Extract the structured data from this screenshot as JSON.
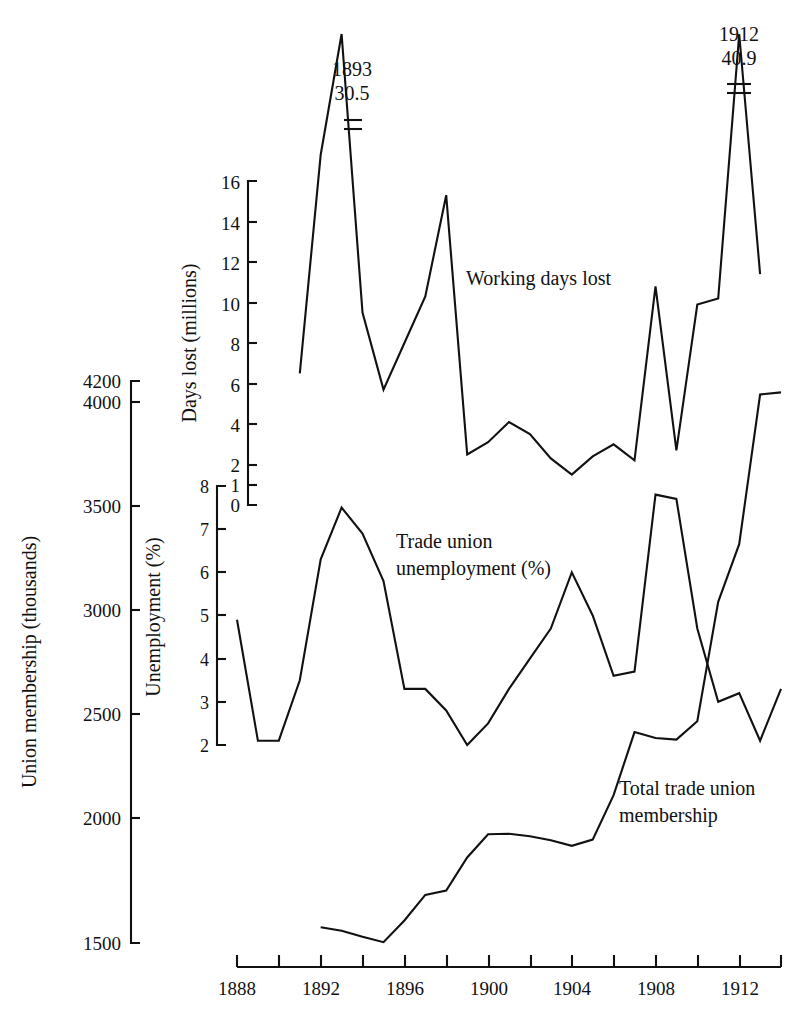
{
  "chart_data": {
    "type": "line",
    "title": "",
    "xlabel": "",
    "x_axis": {
      "min": 1888,
      "max": 1914,
      "tick_labels": [
        "1888",
        "1892",
        "1896",
        "1900",
        "1904",
        "1908",
        "1912"
      ],
      "tick_label_years": [
        1888,
        1892,
        1896,
        1900,
        1904,
        1908,
        1912
      ],
      "minor_tick_years": [
        1888,
        1890,
        1892,
        1894,
        1896,
        1898,
        1900,
        1902,
        1904,
        1906,
        1908,
        1910,
        1912,
        1914
      ]
    },
    "axes": [
      {
        "id": "membership",
        "label": "Union membership (thousands)",
        "ticks": [
          1500,
          2000,
          2500,
          3000,
          3500,
          4000,
          4200
        ],
        "tick_labels": [
          "1500",
          "2000",
          "2500",
          "3000",
          "3500",
          "4000",
          "4200"
        ],
        "min": 1500,
        "max": 4200
      },
      {
        "id": "unemployment",
        "label": "Unemployment (%)",
        "ticks": [
          2,
          3,
          4,
          5,
          6,
          7,
          8
        ],
        "tick_labels": [
          "2",
          "3",
          "4",
          "5",
          "6",
          "7",
          "8"
        ],
        "min": 2,
        "max": 8
      },
      {
        "id": "dayslost",
        "label": "Days lost (millions)",
        "ticks": [
          0,
          1,
          2,
          4,
          6,
          8,
          10,
          12,
          14,
          16
        ],
        "tick_labels": [
          "0",
          "1",
          "2",
          "4",
          "6",
          "8",
          "10",
          "12",
          "14",
          "16"
        ],
        "min": 0,
        "max": 16
      }
    ],
    "series": [
      {
        "name": "Working days lost",
        "axis": "dayslost",
        "units": "millions",
        "x": [
          1891,
          1892,
          1893,
          1894,
          1895,
          1896,
          1897,
          1898,
          1899,
          1900,
          1901,
          1902,
          1903,
          1904,
          1905,
          1906,
          1907,
          1908,
          1909,
          1910,
          1911,
          1912,
          1913
        ],
        "values": [
          6.5,
          17.3,
          30.5,
          9.5,
          5.7,
          8.0,
          10.3,
          15.3,
          2.5,
          3.1,
          4.1,
          3.5,
          2.3,
          1.5,
          2.4,
          3.0,
          2.2,
          10.8,
          2.7,
          9.9,
          10.2,
          40.9,
          11.4
        ]
      },
      {
        "name": "Trade union unemployment (%)",
        "axis": "unemployment",
        "units": "%",
        "x": [
          1888,
          1889,
          1890,
          1891,
          1892,
          1893,
          1894,
          1895,
          1896,
          1897,
          1898,
          1899,
          1900,
          1901,
          1902,
          1903,
          1904,
          1905,
          1906,
          1907,
          1908,
          1909,
          1910,
          1911,
          1912,
          1913,
          1914
        ],
        "values": [
          4.9,
          2.1,
          2.1,
          3.5,
          6.3,
          7.5,
          6.9,
          5.8,
          3.3,
          3.3,
          2.8,
          2.0,
          2.5,
          3.3,
          4.0,
          4.7,
          6.0,
          5.0,
          3.6,
          3.7,
          7.8,
          7.7,
          4.7,
          3.0,
          3.2,
          2.1,
          3.3
        ]
      },
      {
        "name": "Total trade union membership",
        "axis": "membership",
        "units": "thousands",
        "x": [
          1892,
          1893,
          1894,
          1895,
          1896,
          1897,
          1898,
          1899,
          1900,
          1901,
          1902,
          1903,
          1904,
          1905,
          1906,
          1907,
          1908,
          1909,
          1910,
          1911,
          1912,
          1913,
          1914
        ],
        "values": [
          1576,
          1559,
          1530,
          1504,
          1608,
          1731,
          1752,
          1911,
          2022,
          2025,
          2013,
          1994,
          1967,
          1997,
          2210,
          2513,
          2485,
          2477,
          2565,
          3139,
          3416,
          4135,
          4145
        ]
      }
    ],
    "annotations": [
      {
        "id": "annot-1893",
        "year_label": "1893",
        "value_label": "30.5",
        "series": "Working days lost"
      },
      {
        "id": "annot-1912",
        "year_label": "1912",
        "value_label": "40.9",
        "series": "Working days lost"
      }
    ],
    "series_labels": [
      {
        "id": "label-working-days-lost",
        "line1": "Working days lost",
        "line2": ""
      },
      {
        "id": "label-unemployment",
        "line1": "Trade union",
        "line2": "unemployment (%)"
      },
      {
        "id": "label-membership",
        "line1": "Total trade union",
        "line2": "membership"
      }
    ],
    "colors": {
      "ink": "#111111",
      "background": "#ffffff"
    },
    "grid": false,
    "legend": "inline-labels"
  }
}
